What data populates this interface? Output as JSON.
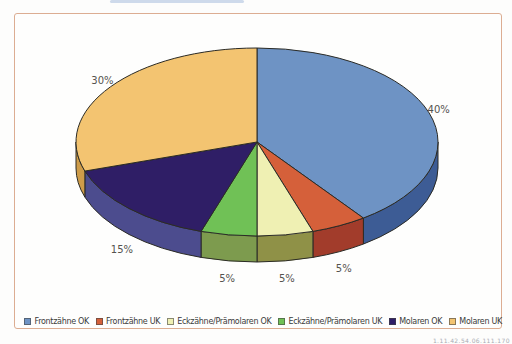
{
  "page": {
    "background": "#FFFFFF",
    "frame_color": "#DCAD92",
    "scan_artifacts": {
      "top_smudge_color": "#C5D4E8",
      "footer_text": "1.11.42.54.06.111.170"
    }
  },
  "chart_data": {
    "type": "pie",
    "style": "3d",
    "title": "",
    "unit": "%",
    "direction": "clockwise",
    "start_angle_deg": 0,
    "legend_position": "bottom",
    "label_color": "#55534E",
    "outline_color": "#2B2B26",
    "slices": [
      {
        "label": "Frontzähne OK",
        "value": 40,
        "color": "#6E93C4",
        "side_color": "#3D5C95"
      },
      {
        "label": "Frontzähne UK",
        "value": 5,
        "color": "#D5603A",
        "side_color": "#A23C2B"
      },
      {
        "label": "Eckzähne/Prämolaren OK",
        "value": 5,
        "color": "#EFF0B3",
        "side_color": "#8F9147"
      },
      {
        "label": "Eckzähne/Prämolaren UK",
        "value": 5,
        "color": "#70C156",
        "side_color": "#7D9B4E"
      },
      {
        "label": "Molaren OK",
        "value": 15,
        "color": "#2F1E66",
        "side_color": "#4C4C8E"
      },
      {
        "label": "Molaren UK",
        "value": 30,
        "color": "#F3C471",
        "side_color": "#CE9C49"
      }
    ]
  }
}
